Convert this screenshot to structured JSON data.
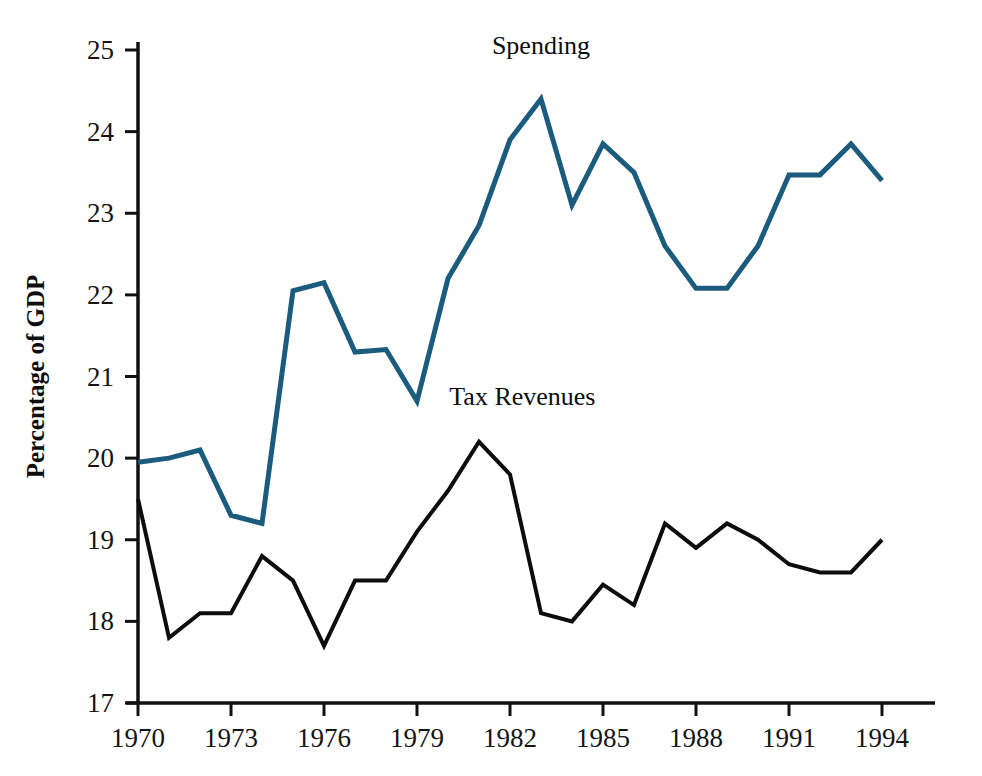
{
  "chart_data": {
    "type": "line",
    "title": "",
    "xlabel": "",
    "ylabel": "Percentage of GDP",
    "xlim": [
      1970,
      1994
    ],
    "ylim": [
      17,
      25
    ],
    "grid": false,
    "legend_position": "inline-annotation",
    "x": [
      1970,
      1971,
      1972,
      1973,
      1974,
      1975,
      1976,
      1977,
      1978,
      1979,
      1980,
      1981,
      1982,
      1983,
      1984,
      1985,
      1986,
      1987,
      1988,
      1989,
      1990,
      1991,
      1992,
      1993,
      1994
    ],
    "x_tick_labels": [
      "1970",
      "1973",
      "1976",
      "1979",
      "1982",
      "1985",
      "1988",
      "1991",
      "1994"
    ],
    "x_tick_values": [
      1970,
      1973,
      1976,
      1979,
      1982,
      1985,
      1988,
      1991,
      1994
    ],
    "y_tick_labels": [
      "17",
      "18",
      "19",
      "20",
      "21",
      "22",
      "23",
      "24",
      "25"
    ],
    "y_tick_values": [
      17,
      18,
      19,
      20,
      21,
      22,
      23,
      24,
      25
    ],
    "series": [
      {
        "name": "Spending",
        "color": "#1b5b7d",
        "stroke_width": 5,
        "label_x": 1983,
        "label_y": 24.95,
        "values": [
          19.95,
          20.0,
          20.1,
          19.3,
          19.2,
          22.05,
          22.15,
          21.3,
          21.33,
          20.7,
          22.2,
          22.85,
          23.9,
          24.4,
          23.1,
          23.85,
          23.5,
          22.6,
          22.08,
          22.08,
          22.6,
          23.47,
          23.47,
          23.85,
          23.4
        ]
      },
      {
        "name": "Tax Revenues",
        "color": "#0d0d0d",
        "stroke_width": 4,
        "label_x": 1982.4,
        "label_y": 20.65,
        "values": [
          19.5,
          17.8,
          18.1,
          18.1,
          18.8,
          18.5,
          17.7,
          18.5,
          18.5,
          19.1,
          19.6,
          20.2,
          19.8,
          18.1,
          18.0,
          18.45,
          18.2,
          19.2,
          18.9,
          19.2,
          19.0,
          18.7,
          18.6,
          18.6,
          19.0
        ]
      }
    ]
  },
  "axes": {
    "y_axis_title": "Percentage of GDP"
  }
}
